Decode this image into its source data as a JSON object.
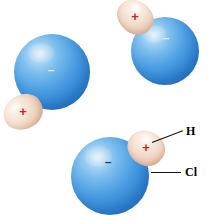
{
  "figure": {
    "background_color": "#ffffff",
    "width": 211,
    "height": 220
  },
  "palette": {
    "chlorine_core": "#a9d5f3",
    "chlorine_edge": "#2a72c4",
    "chlorine_highlight": "#cfe7f8",
    "hydrogen_core": "#fdf6f0",
    "hydrogen_edge": "#d8ab94",
    "positive_charge": "#d4202a",
    "negative_charge_light": "#ebf8ff",
    "negative_charge_dark": "#19456f",
    "leader_line": "#111111",
    "label_text": "#000000"
  },
  "glyphs": {
    "plus": "+",
    "minus": "–"
  },
  "molecules": [
    {
      "id": "molecule-left",
      "chlorine": {
        "label": "Cl",
        "charge": "–",
        "charge_style": "light",
        "cx": 52,
        "cy": 72,
        "r": 38
      },
      "hydrogen": {
        "label": "H",
        "charge": "+",
        "cx": 23,
        "cy": 112,
        "rx": 20,
        "ry": 17,
        "rotation": -28
      }
    },
    {
      "id": "molecule-top-right",
      "chlorine": {
        "label": "Cl",
        "charge": "–",
        "charge_style": "light",
        "cx": 165,
        "cy": 51,
        "r": 34
      },
      "hydrogen": {
        "label": "H",
        "charge": "+",
        "cx": 135,
        "cy": 17,
        "rx": 19,
        "ry": 16,
        "rotation": 38
      }
    },
    {
      "id": "molecule-bottom-labeled",
      "chlorine": {
        "label": "Cl",
        "charge": "–",
        "charge_style": "dark",
        "cx": 110,
        "cy": 176,
        "r": 39
      },
      "hydrogen": {
        "label": "H",
        "charge": "+",
        "cx": 146,
        "cy": 148,
        "rx": 19,
        "ry": 17,
        "rotation": 32
      }
    }
  ],
  "callouts": [
    {
      "id": "callout-hydrogen",
      "label": "H",
      "label_x": 186,
      "label_y": 125,
      "line_x": 152,
      "line_y": 142,
      "line_length": 33,
      "line_angle": -21
    },
    {
      "id": "callout-chlorine",
      "label": "Cl",
      "label_x": 185,
      "label_y": 166,
      "line_x": 151,
      "line_y": 172,
      "line_length": 30,
      "line_angle": 0
    }
  ]
}
